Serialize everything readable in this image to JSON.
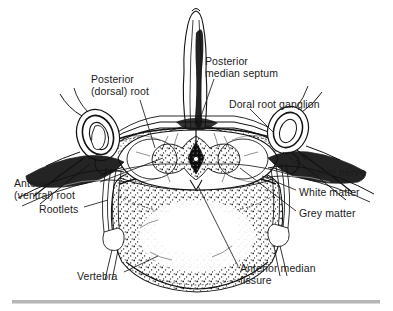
{
  "figure": {
    "kind": "anatomical-line-drawing",
    "ink_color": "#111111",
    "background_color": "#ffffff"
  },
  "labels": [
    {
      "name": "label-posterior-dorsal-root",
      "lines": [
        "Posterior",
        "(dorsal) root"
      ],
      "text": "Posterior\n(dorsal) root",
      "x": 91,
      "y": 73
    },
    {
      "name": "label-posterior-median-septum",
      "lines": [
        "Posterior",
        "median septum"
      ],
      "text": "Posterior\nmedian septum",
      "x": 205,
      "y": 55
    },
    {
      "name": "label-doral-root-ganglion",
      "lines": [
        "Doral root ganglion"
      ],
      "text": "Doral root ganglion",
      "x": 229,
      "y": 98
    },
    {
      "name": "label-anterior-ventral-root",
      "lines": [
        "Anterior",
        "(ventral) root"
      ],
      "text": "Anterior\n(ventral) root",
      "x": 14,
      "y": 177
    },
    {
      "name": "label-rootlets",
      "lines": [
        "Rootlets"
      ],
      "text": "Rootlets",
      "x": 39,
      "y": 203
    },
    {
      "name": "label-spinal-nerve",
      "lines": [
        "Spinal nerve"
      ],
      "text": "Spinal nerve",
      "x": 306,
      "y": 166
    },
    {
      "name": "label-white-matter",
      "lines": [
        "White matter"
      ],
      "text": "White matter",
      "x": 299,
      "y": 186
    },
    {
      "name": "label-grey-matter",
      "lines": [
        "Grey matter"
      ],
      "text": "Grey matter",
      "x": 299,
      "y": 207
    },
    {
      "name": "label-vertebra",
      "lines": [
        "Vertebra"
      ],
      "text": "Vertebra",
      "x": 77,
      "y": 270
    },
    {
      "name": "label-anterior-median-fissure",
      "lines": [
        "Anterior median",
        "fissure"
      ],
      "text": "Anterior median\nfissure",
      "x": 240,
      "y": 262
    }
  ],
  "divider": {
    "name": "footer-rule",
    "color": "#b6b6b6"
  }
}
